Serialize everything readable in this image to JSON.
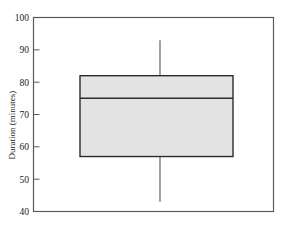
{
  "chart_data": {
    "type": "box",
    "title": "",
    "xlabel": "",
    "ylabel": "Duration (minutes)",
    "ylim": [
      40,
      100
    ],
    "yticks": [
      40,
      50,
      60,
      70,
      80,
      90,
      100
    ],
    "ytick_labels": [
      "40",
      "50",
      "60",
      "70",
      "80",
      "90",
      "100"
    ],
    "grid": false,
    "legend": false,
    "categories": [
      ""
    ],
    "boxes": [
      {
        "label": "",
        "min": 43,
        "q1": 57,
        "median": 75,
        "q3": 82,
        "max": 93,
        "outliers": [],
        "fill_color": "#e3e3e3",
        "line_color": "#2b2b2b"
      }
    ],
    "frame": {
      "border_color": "#5a5a5a",
      "background": "#ffffff"
    }
  },
  "axis": {
    "y_title": "Duration (minutes)",
    "tick_100": "100",
    "tick_90": "90",
    "tick_80": "80",
    "tick_70": "70",
    "tick_60": "60",
    "tick_50": "50",
    "tick_40": "40"
  }
}
